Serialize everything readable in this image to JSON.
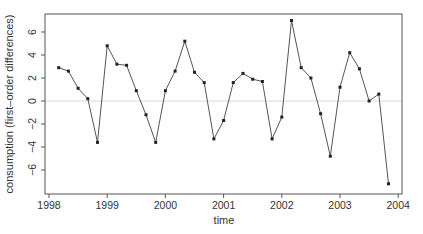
{
  "chart_data": {
    "type": "line",
    "title": "",
    "xlabel": "time",
    "ylabel": "consumption (first–order differences)",
    "xlim": [
      1997.9,
      2004.1
    ],
    "ylim": [
      -8,
      7.5
    ],
    "x_ticks": [
      1998,
      1999,
      2000,
      2001,
      2002,
      2003,
      2004
    ],
    "x_tick_labels": [
      "1998",
      "1999",
      "2000",
      "2001",
      "2002",
      "2003",
      "2004"
    ],
    "y_ticks": [
      -6,
      -4,
      -2,
      0,
      2,
      4,
      6
    ],
    "y_tick_labels": [
      "-6",
      "-4",
      "-2",
      "0",
      "2",
      "4",
      "6"
    ],
    "grid": false,
    "reference_line": {
      "y": 0,
      "color": "#d9d9d9"
    },
    "legend": null,
    "series": [
      {
        "name": "consumption (first-order differences)",
        "color": "#555555",
        "marker": "square",
        "x": [
          1998.167,
          1998.333,
          1998.5,
          1998.667,
          1998.833,
          1999.0,
          1999.167,
          1999.333,
          1999.5,
          1999.667,
          1999.833,
          2000.0,
          2000.167,
          2000.333,
          2000.5,
          2000.667,
          2000.833,
          2001.0,
          2001.167,
          2001.333,
          2001.5,
          2001.667,
          2001.833,
          2002.0,
          2002.167,
          2002.333,
          2002.5,
          2002.667,
          2002.833,
          2003.0,
          2003.167,
          2003.333,
          2003.5,
          2003.667,
          2003.833
        ],
        "values": [
          2.9,
          2.6,
          1.1,
          0.2,
          -3.6,
          4.8,
          3.2,
          3.1,
          0.9,
          -1.2,
          -3.6,
          0.9,
          2.6,
          5.2,
          2.5,
          1.6,
          -3.3,
          -1.7,
          1.6,
          2.4,
          1.9,
          1.7,
          -3.3,
          -1.4,
          7.0,
          2.9,
          2.0,
          -1.1,
          -4.8,
          1.2,
          4.2,
          2.8,
          0.0,
          0.6,
          -7.2
        ]
      }
    ]
  }
}
